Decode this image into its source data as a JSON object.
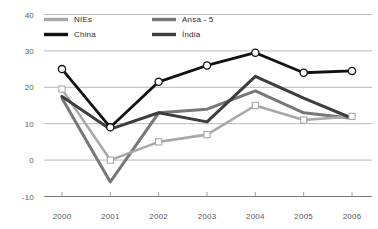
{
  "top_fragment": "",
  "chart_data": {
    "type": "line",
    "title": "",
    "xlabel": "",
    "ylabel": "",
    "x": [
      "2000",
      "2001",
      "2002",
      "2003",
      "2004",
      "2005",
      "2006"
    ],
    "categories": [
      "2000",
      "2001",
      "2002",
      "2003",
      "2004",
      "2005",
      "2006"
    ],
    "ylim": [
      -10,
      40
    ],
    "yticks": [
      40,
      30,
      20,
      10,
      0,
      -10
    ],
    "ytick_labels": [
      "40",
      "30",
      "20",
      "10",
      "0",
      "-10"
    ],
    "xtick_labels": [
      "2000",
      "2001",
      "2002",
      "2003",
      "2004",
      "2005",
      "2006"
    ],
    "grid": true,
    "legend_position": "top-left-inside",
    "series": [
      {
        "name": "NIEs",
        "color": "#a8a8a8",
        "marker": "square",
        "width": 2.6,
        "values": [
          19.5,
          0,
          5,
          7,
          15,
          11,
          12
        ]
      },
      {
        "name": "Ansa - 5",
        "color": "#777777",
        "marker": "none",
        "width": 3.0,
        "values": [
          17,
          -6,
          13,
          14,
          19,
          13,
          11.5
        ]
      },
      {
        "name": "China",
        "color": "#111111",
        "marker": "circle",
        "width": 2.8,
        "values": [
          25,
          9,
          21.5,
          26,
          29.5,
          24,
          24.5
        ]
      },
      {
        "name": "Índia",
        "color": "#3d3d3d",
        "marker": "none",
        "width": 3.0,
        "values": [
          17.5,
          8.5,
          13,
          10.5,
          23,
          17,
          11.5
        ]
      }
    ]
  },
  "legend": {
    "items": [
      {
        "label": "NIEs",
        "swatch": "#a8a8a8"
      },
      {
        "label": "Ansa - 5",
        "swatch": "#777777"
      },
      {
        "label": "China",
        "swatch": "#111111"
      },
      {
        "label": "Índia",
        "swatch": "#3d3d3d"
      }
    ]
  }
}
